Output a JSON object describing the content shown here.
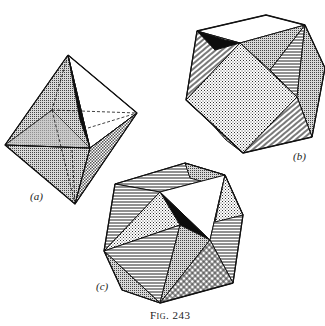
{
  "figure": {
    "caption": "Fig. 243",
    "panels": [
      {
        "label": "(a)",
        "description": "octahedron with shaded faces and dashed hidden edges"
      },
      {
        "label": "(b)",
        "description": "cuboctahedron with stippled, hatched and black faces"
      },
      {
        "label": "(c)",
        "description": "combined crystal form with hatched, stippled and black faces"
      }
    ]
  },
  "colors": {
    "line": "#111111",
    "black_face": "#0d0d0d",
    "gray_face": "#b8b8b8",
    "background": "#ffffff"
  }
}
